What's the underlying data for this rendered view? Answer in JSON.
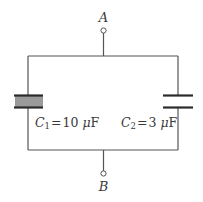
{
  "diagram": {
    "type": "circuit",
    "terminals": [
      {
        "id": "A",
        "label": "A"
      },
      {
        "id": "B",
        "label": "B"
      }
    ],
    "components": [
      {
        "id": "C1",
        "symbol": "C",
        "subscript": "1",
        "equals": "=",
        "value": "10",
        "unit_prefix": "μ",
        "unit": "F",
        "label_text": "C1 = 10 μF",
        "dielectric": true,
        "dielectric_color": "#9a9a9a"
      },
      {
        "id": "C2",
        "symbol": "C",
        "subscript": "2",
        "equals": "=",
        "value": "3",
        "unit_prefix": "μ",
        "unit": "F",
        "label_text": "C2 = 3 μF",
        "dielectric": false
      }
    ],
    "colors": {
      "wire": "#555555",
      "plate": "#2b2b2b",
      "text": "#3a3a3a",
      "background": "#ffffff"
    }
  }
}
